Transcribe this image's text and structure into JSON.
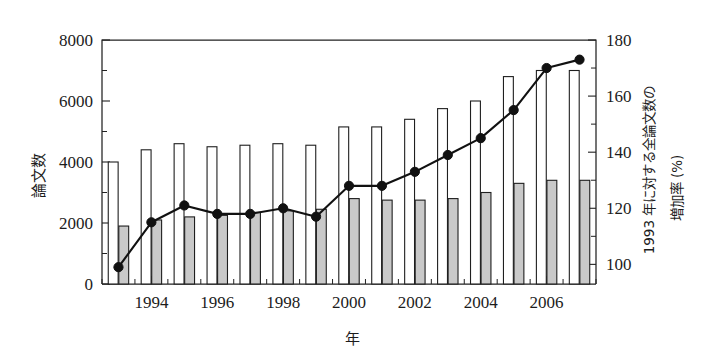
{
  "chart_data": {
    "type": "bar",
    "title": "",
    "subtitle": "",
    "xlabel": "年",
    "ylabel": "論文数",
    "ylabel_right_line1": "1993 年に対する全論文数の",
    "ylabel_right_line2": "増加率 (%)",
    "grid": false,
    "legend": "none",
    "categories": [
      1993,
      1994,
      1995,
      1996,
      1997,
      1998,
      1999,
      2000,
      2001,
      2002,
      2003,
      2004,
      2005,
      2006,
      2007
    ],
    "x": [
      "1993",
      "1994",
      "1995",
      "1996",
      "1997",
      "1998",
      "1999",
      "2000",
      "2001",
      "2002",
      "2003",
      "2004",
      "2005",
      "2006",
      "2007"
    ],
    "xtick_labels": [
      "1994",
      "1996",
      "1998",
      "2000",
      "2002",
      "2004",
      "2006"
    ],
    "xtick_values": [
      1994,
      1996,
      1998,
      2000,
      2002,
      2004,
      2006
    ],
    "ylim": [
      0,
      8000
    ],
    "ytick_labels": [
      "0",
      "2000",
      "4000",
      "6000",
      "8000"
    ],
    "ytick_values": [
      0,
      2000,
      4000,
      6000,
      8000
    ],
    "yminor_values": [
      1000,
      3000,
      5000,
      7000
    ],
    "ylim_right": [
      93,
      180
    ],
    "ytick_labels_right": [
      "100",
      "120",
      "140",
      "160",
      "180"
    ],
    "ytick_values_right": [
      100,
      120,
      140,
      160,
      180
    ],
    "yminor_values_right": [
      110,
      130,
      150,
      170
    ],
    "series": [
      {
        "name": "white-bar-series",
        "style": "bar-open",
        "axis": "left",
        "values": [
          4000,
          4400,
          4600,
          4500,
          4550,
          4600,
          4550,
          5150,
          5150,
          5400,
          5750,
          6000,
          6800,
          7000,
          7000
        ]
      },
      {
        "name": "gray-bar-series",
        "style": "bar-filled",
        "axis": "left",
        "values": [
          1900,
          2100,
          2200,
          2250,
          2350,
          2400,
          2450,
          2800,
          2750,
          2750,
          2800,
          3000,
          3300,
          3400,
          3400
        ]
      },
      {
        "name": "growth-rate-line",
        "style": "line-marker",
        "axis": "right",
        "values": [
          99,
          115,
          121,
          118,
          118,
          120,
          117,
          128,
          128,
          133,
          139,
          145,
          155,
          170,
          173
        ]
      }
    ]
  },
  "colors": {
    "bar_open_fill": "#ffffff",
    "bar_filled_fill": "#c9c9c9",
    "stroke": "#1f1f1f",
    "line": "#111111",
    "background": "#ffffff"
  }
}
